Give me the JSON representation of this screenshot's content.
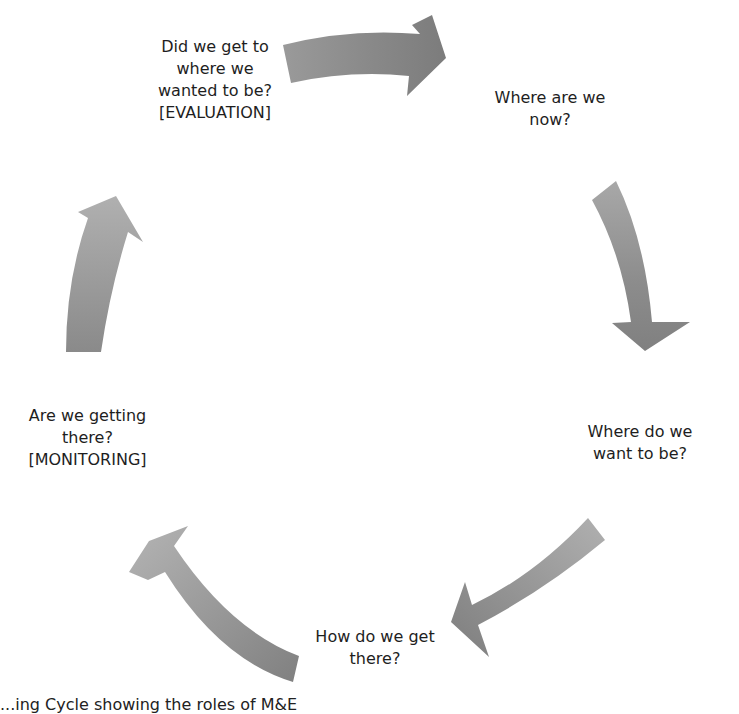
{
  "diagram": {
    "type": "cycle",
    "direction": "clockwise",
    "arrow_color_light": "#b4b4b4",
    "arrow_color_dark": "#7a7a7a",
    "nodes": [
      {
        "id": "eval",
        "lines": [
          "Did we get to",
          "where we",
          "wanted to be?",
          "[EVALUATION]"
        ]
      },
      {
        "id": "now",
        "lines": [
          "Where are we",
          "now?"
        ]
      },
      {
        "id": "want",
        "lines": [
          "Where do we",
          "want to be?"
        ]
      },
      {
        "id": "how",
        "lines": [
          "How do we get",
          "there?"
        ]
      },
      {
        "id": "mon",
        "lines": [
          "Are we getting",
          "there?",
          "[MONITORING]"
        ]
      }
    ],
    "arrows": [
      {
        "from": "eval",
        "to": "now"
      },
      {
        "from": "now",
        "to": "want"
      },
      {
        "from": "want",
        "to": "how"
      },
      {
        "from": "how",
        "to": "mon"
      },
      {
        "from": "mon",
        "to": "eval"
      }
    ]
  },
  "caption": "...ing Cycle showing the roles of M&E"
}
